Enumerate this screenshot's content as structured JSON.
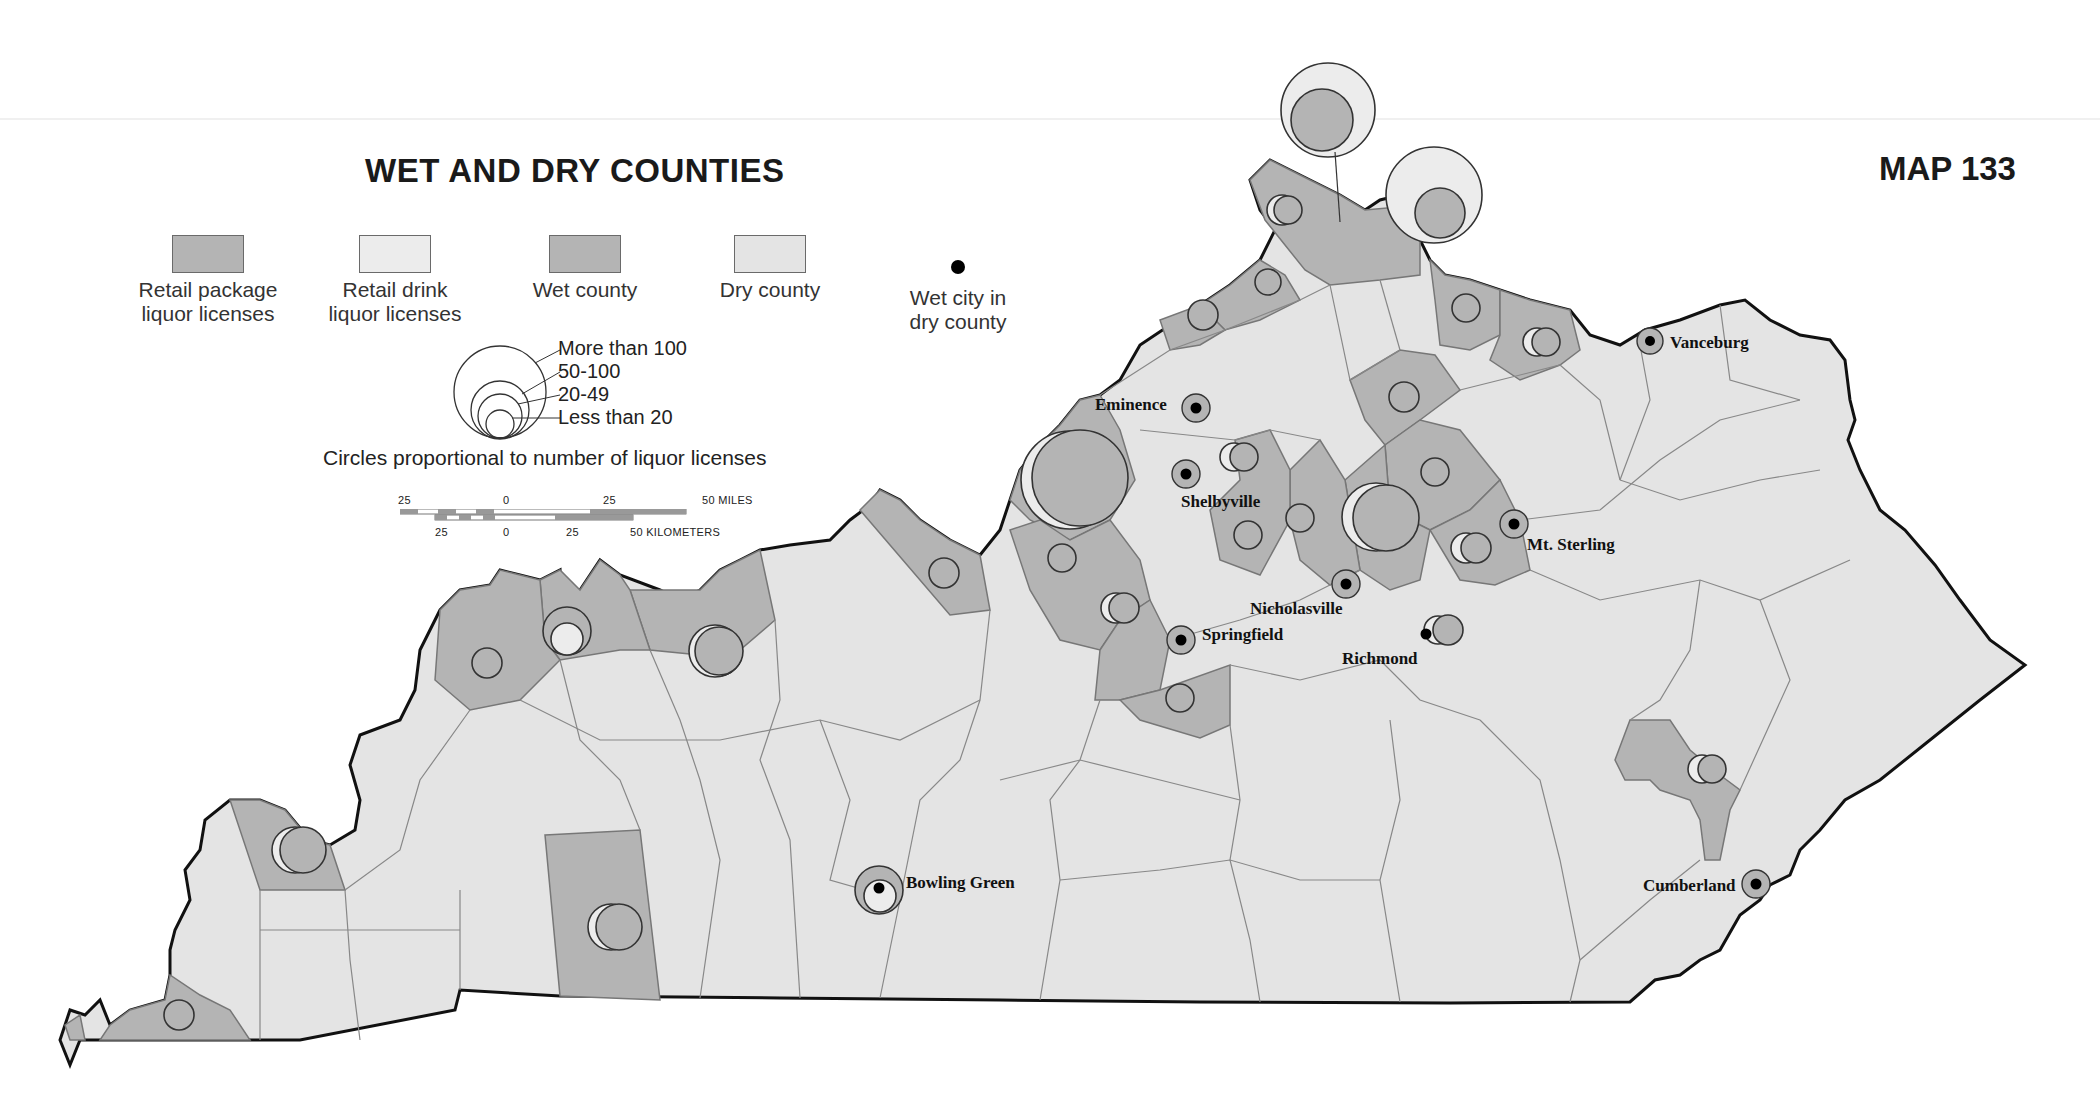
{
  "title": "WET AND DRY COUNTIES",
  "map_number": "MAP 133",
  "colors": {
    "package": "#b4b4b4",
    "drink": "#ececec",
    "wet": "#b4b4b4",
    "dry": "#e4e4e4",
    "border": "#777777",
    "state_outline": "#111111"
  },
  "legend": {
    "items": [
      {
        "label_1": "Retail package",
        "label_2": "liquor licenses",
        "kind": "package"
      },
      {
        "label_1": "Retail drink",
        "label_2": "liquor licenses",
        "kind": "drink"
      },
      {
        "label_1": "Wet county",
        "label_2": "",
        "kind": "wet"
      },
      {
        "label_1": "Dry county",
        "label_2": "",
        "kind": "dry"
      },
      {
        "label_1": "Wet city in",
        "label_2": "dry county",
        "kind": "wet-city"
      }
    ],
    "circle_sizes": [
      "More than 100",
      "50-100",
      "20-49",
      "Less than 20"
    ],
    "circle_caption": "Circles proportional to number of liquor licenses"
  },
  "scale": {
    "miles_ticks": [
      "25",
      "0",
      "25",
      "50 MILES"
    ],
    "km_ticks": [
      "25",
      "0",
      "25",
      "50 KILOMETERS"
    ]
  },
  "cities": [
    {
      "name": "Vanceburg",
      "type": "wet-city"
    },
    {
      "name": "Eminence",
      "type": "wet-city"
    },
    {
      "name": "Shelbyville",
      "type": "wet-city"
    },
    {
      "name": "Mt. Sterling",
      "type": "wet-city"
    },
    {
      "name": "Nicholasville",
      "type": "wet-city"
    },
    {
      "name": "Springfield",
      "type": "wet-city"
    },
    {
      "name": "Richmond",
      "type": "wet-city"
    },
    {
      "name": "Bowling Green",
      "type": "wet-city"
    },
    {
      "name": "Cumberland",
      "type": "wet-city"
    }
  ]
}
